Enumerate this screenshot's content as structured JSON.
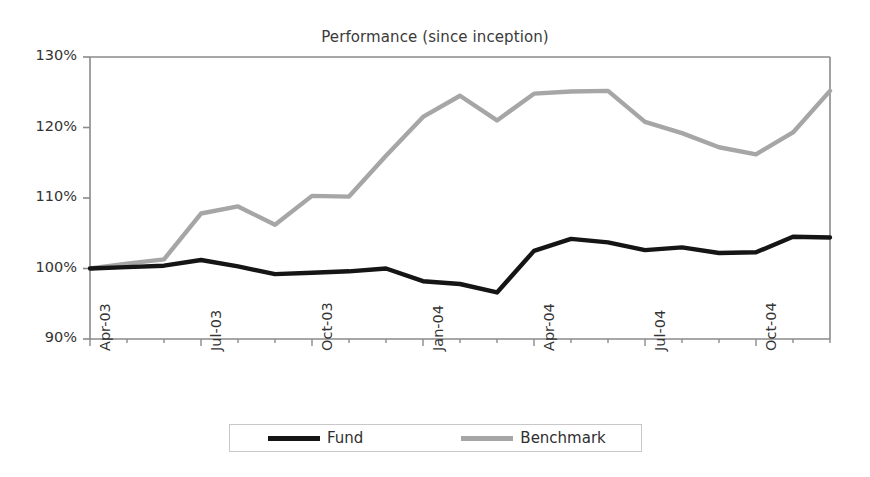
{
  "chart_data": {
    "type": "line",
    "title": "Performance (since inception)",
    "xlabel": "",
    "ylabel": "",
    "ylim": [
      90,
      130
    ],
    "ytick_values": [
      90,
      100,
      110,
      120,
      130
    ],
    "ytick_labels": [
      "90%",
      "100%",
      "110%",
      "120%",
      "130%"
    ],
    "grid": false,
    "legend_position": "bottom",
    "x": [
      "Apr-03",
      "May-03",
      "Jun-03",
      "Jul-03",
      "Aug-03",
      "Sep-03",
      "Oct-03",
      "Nov-03",
      "Dec-03",
      "Jan-04",
      "Feb-04",
      "Mar-04",
      "Apr-04",
      "May-04",
      "Jun-04",
      "Jul-04",
      "Aug-04",
      "Sep-04",
      "Oct-04",
      "Nov-04",
      "Dec-04"
    ],
    "xtick_labels": [
      "Apr-03",
      "Jul-03",
      "Oct-03",
      "Jan-04",
      "Apr-04",
      "Jul-04",
      "Oct-04"
    ],
    "xtick_indices": [
      0,
      3,
      6,
      9,
      12,
      15,
      18
    ],
    "series": [
      {
        "name": "Fund",
        "color": "#151515",
        "values": [
          100.0,
          100.2,
          100.4,
          101.2,
          100.3,
          99.2,
          99.4,
          99.6,
          100.0,
          98.2,
          97.8,
          96.6,
          102.5,
          104.2,
          103.7,
          102.6,
          103.0,
          102.2,
          102.3,
          104.5,
          104.4
        ]
      },
      {
        "name": "Benchmark",
        "color": "#a6a6a6",
        "values": [
          100.0,
          100.7,
          101.3,
          107.8,
          108.8,
          106.2,
          110.3,
          110.2,
          116.0,
          121.5,
          124.5,
          121.0,
          124.8,
          125.1,
          125.2,
          120.8,
          119.2,
          117.2,
          116.2,
          119.3,
          125.2
        ]
      }
    ]
  },
  "legend": {
    "fund_label": "Fund",
    "benchmark_label": "Benchmark"
  },
  "colors": {
    "fund": "#151515",
    "benchmark": "#a6a6a6",
    "axis": "#8a8a8a",
    "text": "#333333"
  }
}
